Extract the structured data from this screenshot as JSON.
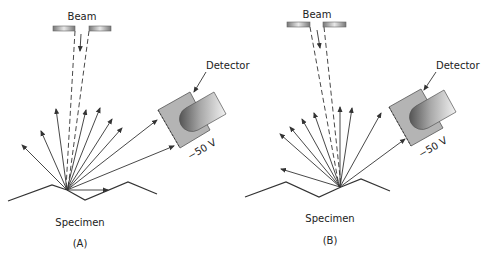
{
  "panels": [
    {
      "id": "A",
      "caption": "(A)",
      "beam_label": "Beam",
      "detector_label": "Detector",
      "voltage_label": "−50 V",
      "specimen_label": "Specimen",
      "description": "Beam hits flat facet of specimen; many secondary electrons reach detector"
    },
    {
      "id": "B",
      "caption": "(B)",
      "beam_label": "Beam",
      "detector_label": "Detector",
      "voltage_label": "−50 V",
      "specimen_label": "Specimen",
      "description": "Beam hits valley of specimen; fewer electrons reach detector"
    }
  ],
  "colors": {
    "line": "#333333",
    "detector_fill": "#b4b4b4",
    "aperture": "#8a8a8a"
  }
}
